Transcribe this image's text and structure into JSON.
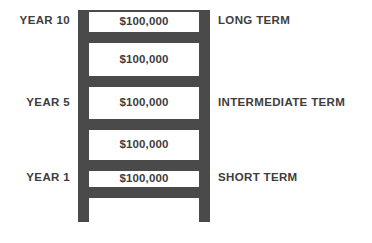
{
  "diagram": {
    "type": "ladder-diagram",
    "colors": {
      "ladder": "#4a4a4a",
      "text": "#3d3d3d",
      "background": "#ffffff"
    }
  },
  "rungs": [
    {
      "id": "rung-top",
      "top": 10
    },
    {
      "id": "rung-1",
      "top": 32
    },
    {
      "id": "rung-2",
      "top": 76
    },
    {
      "id": "rung-3",
      "top": 119
    },
    {
      "id": "rung-4",
      "top": 160
    },
    {
      "id": "rung-bottom",
      "top": 187
    }
  ],
  "steps": [
    {
      "amount": "$100,000",
      "year_label": "YEAR 10",
      "term_label": "LONG TERM",
      "top": 12,
      "height": 20,
      "label_top": 15
    },
    {
      "amount": "$100,000",
      "year_label": "",
      "term_label": "",
      "top": 43,
      "height": 33,
      "label_top": 53
    },
    {
      "amount": "$100,000",
      "year_label": "YEAR 5",
      "term_label": "INTERMEDIATE TERM",
      "top": 87,
      "height": 32,
      "label_top": 97
    },
    {
      "amount": "$100,000",
      "year_label": "",
      "term_label": "",
      "top": 130,
      "height": 30,
      "label_top": 139
    },
    {
      "amount": "$100,000",
      "year_label": "YEAR 1",
      "term_label": "SHORT TERM",
      "top": 171,
      "height": 16,
      "label_top": 172
    }
  ],
  "chart_data": {
    "type": "bar",
    "xlabel": "",
    "ylabel": "",
    "categories": [
      "YEAR 1",
      "",
      "YEAR 5",
      "",
      "YEAR 10"
    ],
    "values": [
      100000,
      100000,
      100000,
      100000,
      100000
    ],
    "value_labels": [
      "$100,000",
      "$100,000",
      "$100,000",
      "$100,000",
      "$100,000"
    ],
    "annotations": [
      "SHORT TERM",
      "",
      "INTERMEDIATE TERM",
      "",
      "LONG TERM"
    ],
    "legend": [],
    "grid": false
  }
}
